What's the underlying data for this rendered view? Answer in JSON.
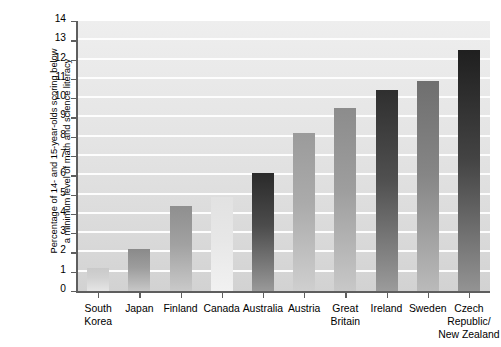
{
  "chart_data": {
    "type": "bar",
    "title": "",
    "xlabel": "",
    "ylabel": "Percentage of 14- and 15-year-olds scoring below a minimum level of math and science literacy",
    "ylabel_line1": "Percentage of 14- and 15-year-olds scoring below",
    "ylabel_line2": "a minimum level of math and science literacy",
    "categories": [
      "South\nKorea",
      "Japan",
      "Finland",
      "Canada",
      "Australia",
      "Austria",
      "Great\nBritain",
      "Ireland",
      "Sweden",
      "Czech\nRepublic/\nNew Zealand"
    ],
    "values": [
      1.2,
      2.2,
      4.4,
      4.9,
      6.1,
      8.2,
      9.5,
      10.4,
      10.9,
      12.5
    ],
    "ylim": [
      0,
      14
    ],
    "ytick_labels": [
      "0",
      "1",
      "2",
      "3",
      "4",
      "5",
      "6",
      "7",
      "8",
      "9",
      "10",
      "11",
      "12",
      "13",
      "14"
    ],
    "ytick_values": [
      0,
      1,
      2,
      3,
      4,
      5,
      6,
      7,
      8,
      9,
      10,
      11,
      12,
      13,
      14
    ],
    "grid": "horizontal-white",
    "legend": "none",
    "bar_colors": [
      "#c9c9c9",
      "#8a8a8a",
      "#8f8f8f",
      "#e2e2e2",
      "#2a2a2a",
      "#9b9b9b",
      "#8c8c8c",
      "#2f2f2f",
      "#6f6f6f",
      "#1f1f1f"
    ],
    "background_color": "#e3e3e3",
    "axis_color": "#5e5e5e"
  }
}
